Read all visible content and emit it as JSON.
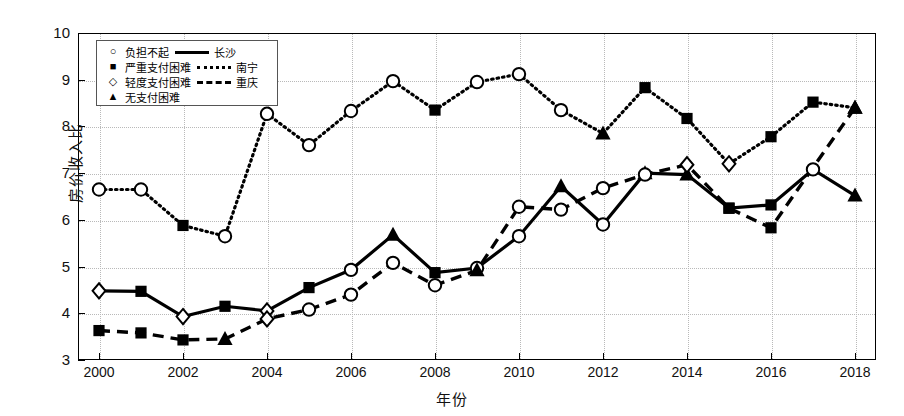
{
  "axes": {
    "ylabel": "房价收入比",
    "xlabel": "年份",
    "yticks": [
      "3",
      "4",
      "5",
      "6",
      "7",
      "8",
      "9",
      "10"
    ],
    "xticks": [
      "2000",
      "2002",
      "2004",
      "2006",
      "2008",
      "2010",
      "2012",
      "2014",
      "2016",
      "2018"
    ]
  },
  "legend": {
    "markers": [
      {
        "glyph": "○",
        "label": "负担不起",
        "name": "marker-circle"
      },
      {
        "glyph": "■",
        "label": "严重支付困难",
        "name": "marker-square"
      },
      {
        "glyph": "◇",
        "label": "轻度支付困难",
        "name": "marker-diamond"
      },
      {
        "glyph": "▲",
        "label": "无支付困难",
        "name": "marker-triangle"
      }
    ],
    "lines": [
      {
        "style": "solid",
        "label": "长沙"
      },
      {
        "style": "dotted",
        "label": "南宁"
      },
      {
        "style": "dashed",
        "label": "重庆"
      }
    ]
  },
  "chart_data": {
    "type": "line",
    "title": "",
    "xlabel": "年份",
    "ylabel": "房价收入比",
    "xlim": [
      1999.5,
      2018.5
    ],
    "ylim": [
      3,
      10
    ],
    "grid": true,
    "legend_position": "top-left",
    "x": [
      2000,
      2001,
      2002,
      2003,
      2004,
      2005,
      2006,
      2007,
      2008,
      2009,
      2010,
      2011,
      2012,
      2013,
      2014,
      2015,
      2016,
      2017,
      2018
    ],
    "series": [
      {
        "name": "长沙",
        "line_style": "solid",
        "values": [
          4.48,
          4.47,
          3.93,
          4.15,
          4.05,
          4.55,
          4.93,
          5.68,
          4.87,
          4.97,
          5.65,
          6.72,
          5.9,
          7.0,
          6.97,
          6.25,
          6.32,
          7.08,
          6.52
        ],
        "markers": [
          "diamond",
          "square",
          "diamond",
          "square",
          "diamond",
          "square",
          "circle",
          "triangle",
          "square",
          "circle",
          "circle",
          "triangle",
          "circle",
          "triangle",
          "triangle",
          "square",
          "square",
          "circle",
          "triangle"
        ]
      },
      {
        "name": "南宁",
        "line_style": "dotted",
        "values": [
          6.65,
          6.65,
          5.88,
          5.65,
          8.27,
          7.6,
          8.33,
          8.97,
          8.35,
          8.95,
          9.12,
          8.35,
          7.85,
          8.83,
          8.17,
          7.2,
          7.78,
          8.52,
          8.4
        ],
        "markers": [
          "circle",
          "circle",
          "square",
          "circle",
          "circle",
          "circle",
          "circle",
          "circle",
          "square",
          "circle",
          "circle",
          "circle",
          "triangle",
          "square",
          "square",
          "diamond",
          "square",
          "square",
          "triangle"
        ]
      },
      {
        "name": "重庆",
        "line_style": "dashed",
        "values": [
          3.63,
          3.58,
          3.43,
          3.45,
          3.88,
          4.08,
          4.4,
          5.08,
          4.6,
          4.92,
          6.28,
          6.22,
          6.68,
          6.97,
          7.18,
          6.25,
          5.83,
          7.12,
          8.4
        ],
        "markers": [
          "square",
          "square",
          "square",
          "triangle",
          "diamond",
          "circle",
          "circle",
          "circle",
          "circle",
          "triangle",
          "circle",
          "circle",
          "circle",
          "circle",
          "diamond",
          "square",
          "square",
          "none",
          "triangle"
        ]
      }
    ]
  }
}
